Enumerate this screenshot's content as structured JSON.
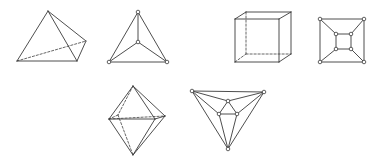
{
  "colors": {
    "background": "#ffffff",
    "line": "#3a3a3a",
    "hidden_line": "#555555"
  },
  "figures": [
    {
      "id": "tetrahedron-solid",
      "name": "tetrahedron",
      "kind": "solid",
      "vertices": [
        [
          48,
          11
        ],
        [
          17,
          61
        ],
        [
          77,
          61
        ],
        [
          86,
          41
        ]
      ],
      "edges": [
        [
          0,
          1
        ],
        [
          0,
          2
        ],
        [
          0,
          3
        ],
        [
          1,
          2
        ],
        [
          2,
          3
        ]
      ],
      "hidden_edges": [
        [
          1,
          3
        ]
      ]
    },
    {
      "id": "tetrahedron-graph",
      "name": "tetrahedron",
      "kind": "graph",
      "vertices": [
        [
          138,
          12
        ],
        [
          138,
          42
        ],
        [
          109,
          62
        ],
        [
          167,
          62
        ]
      ],
      "edges": [
        [
          0,
          1
        ],
        [
          0,
          2
        ],
        [
          0,
          3
        ],
        [
          1,
          2
        ],
        [
          1,
          3
        ],
        [
          2,
          3
        ]
      ],
      "hidden_edges": []
    },
    {
      "id": "cube-solid",
      "name": "cube",
      "kind": "solid",
      "vertices": [
        [
          235,
          19
        ],
        [
          279,
          19
        ],
        [
          279,
          62
        ],
        [
          235,
          62
        ],
        [
          246,
          12
        ],
        [
          291,
          12
        ],
        [
          291,
          54
        ],
        [
          246,
          54
        ]
      ],
      "edges": [
        [
          0,
          1
        ],
        [
          1,
          2
        ],
        [
          2,
          3
        ],
        [
          3,
          0
        ],
        [
          0,
          4
        ],
        [
          1,
          5
        ],
        [
          2,
          6
        ],
        [
          4,
          5
        ],
        [
          5,
          6
        ]
      ],
      "hidden_edges": [
        [
          4,
          7
        ],
        [
          7,
          6
        ],
        [
          3,
          7
        ]
      ]
    },
    {
      "id": "cube-graph",
      "name": "cube",
      "kind": "graph",
      "vertices": [
        [
          320,
          19
        ],
        [
          364,
          19
        ],
        [
          364,
          62
        ],
        [
          320,
          62
        ],
        [
          336,
          34
        ],
        [
          351,
          34
        ],
        [
          351,
          49
        ],
        [
          336,
          49
        ]
      ],
      "edges": [
        [
          0,
          1
        ],
        [
          1,
          2
        ],
        [
          2,
          3
        ],
        [
          3,
          0
        ],
        [
          4,
          5
        ],
        [
          5,
          6
        ],
        [
          6,
          7
        ],
        [
          7,
          4
        ],
        [
          0,
          4
        ],
        [
          1,
          5
        ],
        [
          2,
          6
        ],
        [
          3,
          7
        ]
      ],
      "hidden_edges": []
    },
    {
      "id": "octahedron-solid",
      "name": "octahedron",
      "kind": "solid",
      "vertices": [
        [
          133,
          86
        ],
        [
          133,
          155
        ],
        [
          109,
          119
        ],
        [
          155,
          119
        ],
        [
          165,
          116
        ],
        [
          118,
          115
        ]
      ],
      "edges": [
        [
          0,
          2
        ],
        [
          0,
          3
        ],
        [
          0,
          4
        ],
        [
          1,
          2
        ],
        [
          1,
          3
        ],
        [
          1,
          4
        ],
        [
          2,
          3
        ],
        [
          3,
          4
        ]
      ],
      "hidden_edges": [
        [
          2,
          4
        ],
        [
          0,
          5
        ],
        [
          5,
          1
        ],
        [
          5,
          2
        ]
      ]
    },
    {
      "id": "octahedron-graph",
      "name": "octahedron",
      "kind": "graph",
      "vertices": [
        [
          192,
          91
        ],
        [
          264,
          92
        ],
        [
          228,
          149
        ],
        [
          228,
          101
        ],
        [
          219,
          114
        ],
        [
          237,
          114
        ]
      ],
      "edges": [
        [
          0,
          1
        ],
        [
          0,
          2
        ],
        [
          1,
          2
        ],
        [
          3,
          4
        ],
        [
          3,
          5
        ],
        [
          4,
          5
        ],
        [
          0,
          3
        ],
        [
          1,
          3
        ],
        [
          0,
          4
        ],
        [
          1,
          5
        ],
        [
          2,
          4
        ],
        [
          2,
          5
        ]
      ],
      "hidden_edges": []
    }
  ]
}
